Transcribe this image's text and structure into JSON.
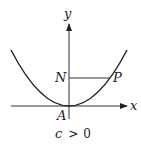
{
  "diagram": {
    "type": "parabola-graph",
    "axes": {
      "x_label": "x",
      "y_label": "y"
    },
    "points": {
      "vertex": "A",
      "on_y_axis": "N",
      "on_curve": "P"
    },
    "caption": {
      "c": "c",
      "op": ">",
      "value": "0"
    },
    "colors": {
      "stroke": "#222222",
      "background": "#ffffff"
    }
  }
}
